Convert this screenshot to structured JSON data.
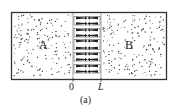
{
  "diagram": {
    "regions": [
      {
        "label": "A",
        "x": 43,
        "y": 45
      },
      {
        "label": "B",
        "x": 129,
        "y": 45
      }
    ],
    "axis_labels": {
      "origin": "0",
      "end": "L"
    },
    "caption": "(a)",
    "channel": {
      "x_start": 73,
      "x_end": 101,
      "arrow_rows": 10,
      "arrow_direction": "inward"
    },
    "colors": {
      "stroke": "#333333",
      "dots": "#444444",
      "background": "#ffffff"
    }
  }
}
